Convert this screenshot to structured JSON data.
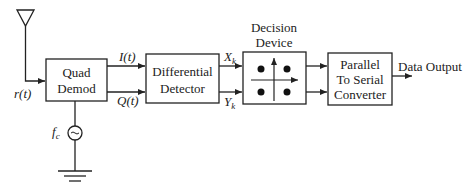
{
  "diagram": {
    "type": "block-diagram",
    "title": "",
    "blocks": {
      "quad_demod": {
        "line1": "Quad",
        "line2": "Demod"
      },
      "differential_detector": {
        "line1": "Differential",
        "line2": "Detector"
      },
      "decision_device": {
        "line1": "Decision",
        "line2": "Device"
      },
      "parallel_to_serial": {
        "line1": "Parallel",
        "line2": "To Serial",
        "line3": "Converter"
      }
    },
    "signals": {
      "input": "r(t)",
      "in_phase": "I(t)",
      "quadrature": "Q(t)",
      "x_k": "X",
      "x_k_sub": "k",
      "y_k": "Y",
      "y_k_sub": "k",
      "carrier": "f",
      "carrier_sub": "c",
      "output": "Data Output"
    },
    "components": [
      "antenna-icon",
      "oscillator-icon",
      "ground-icon",
      "constellation-icon"
    ],
    "colors": {
      "stroke": "#222222",
      "background": "#ffffff"
    }
  }
}
